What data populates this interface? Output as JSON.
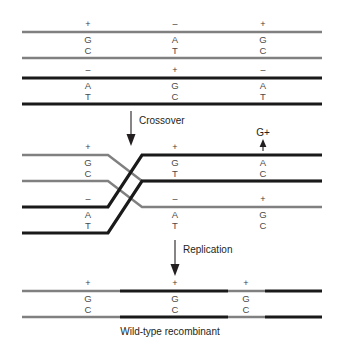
{
  "figure": {
    "caption": "Wild-type recombinant",
    "colors": {
      "gray_strand": "#808080",
      "black_strand": "#1a1a1a",
      "text": "#231f20",
      "base_text": "#4a4a4a",
      "background": "#ffffff"
    }
  },
  "steps": [
    {
      "id": "crossover",
      "label": "Crossover"
    },
    {
      "id": "replication",
      "label": "Replication"
    }
  ],
  "annotations": [
    {
      "id": "g-plus-marker",
      "label": "G+"
    }
  ],
  "stage_parental": {
    "name": "parental-duplexes",
    "duplex_gray": {
      "name": "parental-gray-duplex",
      "color": "gray",
      "sites": [
        {
          "allele": "+",
          "top_base": "G",
          "bottom_base": "C"
        },
        {
          "allele": "–",
          "top_base": "A",
          "bottom_base": "T"
        },
        {
          "allele": "+",
          "top_base": "G",
          "bottom_base": "C"
        }
      ]
    },
    "duplex_black": {
      "name": "parental-black-duplex",
      "color": "black",
      "sites": [
        {
          "allele": "–",
          "top_base": "A",
          "bottom_base": "T"
        },
        {
          "allele": "+",
          "top_base": "G",
          "bottom_base": "C"
        },
        {
          "allele": "–",
          "top_base": "A",
          "bottom_base": "T"
        }
      ]
    }
  },
  "stage_crossover": {
    "name": "crossover-heteroduplexes",
    "duplex_upper": {
      "name": "crossover-upper-duplex",
      "left_sites": [
        {
          "allele": "+",
          "top_base": "G",
          "bottom_base": "C"
        }
      ],
      "right_sites": [
        {
          "allele": "+",
          "top_base": "G",
          "bottom_base": "T"
        },
        {
          "allele": "",
          "top_base": "A",
          "bottom_base": "C"
        }
      ]
    },
    "duplex_lower": {
      "name": "crossover-lower-duplex",
      "left_sites": [
        {
          "allele": "–",
          "top_base": "A",
          "bottom_base": "T"
        }
      ],
      "right_sites": [
        {
          "allele": "–",
          "top_base": "A",
          "bottom_base": "T"
        },
        {
          "allele": "+",
          "top_base": "G",
          "bottom_base": "C"
        }
      ]
    }
  },
  "stage_product": {
    "name": "recombinant-duplex",
    "sites": [
      {
        "allele": "+",
        "top_base": "G",
        "bottom_base": "C"
      },
      {
        "allele": "+",
        "top_base": "G",
        "bottom_base": "C"
      },
      {
        "allele": "+",
        "top_base": "G",
        "bottom_base": "C"
      }
    ]
  }
}
